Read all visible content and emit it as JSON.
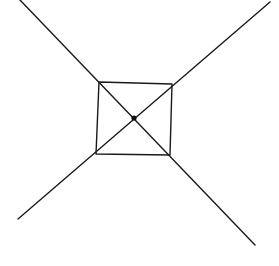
{
  "diagram": {
    "stroke_color": "#1a1a1a",
    "background": "#ffffff",
    "elements": {
      "line_a": {
        "x1": 20,
        "y1": 0,
        "x2": 255,
        "y2": 245
      },
      "line_b": {
        "x1": 270,
        "y1": 2,
        "x2": 18,
        "y2": 219
      },
      "square": {
        "points": "99,82 172,84 170,155 96,154"
      },
      "center_dot": {
        "cx": 134,
        "cy": 118,
        "r": 2.6
      }
    }
  }
}
